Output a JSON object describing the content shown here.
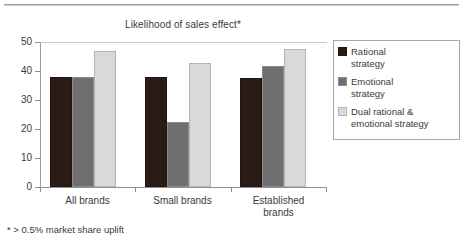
{
  "figure": {
    "top_rule": true,
    "footnote": "* > 0.5% market share uplift"
  },
  "chart_data": {
    "type": "bar",
    "title": "Likelihood of sales effect*",
    "xlabel": "",
    "ylabel": "",
    "ylim": [
      0,
      50
    ],
    "yticks": [
      0,
      10,
      20,
      30,
      40,
      50
    ],
    "ytick_labels": [
      "0",
      "10",
      "20",
      "30",
      "40",
      "50"
    ],
    "grid": false,
    "legend_position": "right",
    "categories": [
      "All brands",
      "Small brands",
      "Established brands"
    ],
    "series": [
      {
        "name": "Rational strategy",
        "legend_label_line1": "Rational",
        "legend_label_line2": "strategy",
        "color": "#2b1b16",
        "values": [
          38,
          37.8,
          37.6
        ]
      },
      {
        "name": "Emotional strategy",
        "legend_label_line1": "Emotional",
        "legend_label_line2": "strategy",
        "color": "#6f6f6f",
        "values": [
          38,
          22.5,
          41.6
        ]
      },
      {
        "name": "Dual rational & emotional strategy",
        "legend_label_line1": "Dual rational &",
        "legend_label_line2": "emotional strategy",
        "color": "#d9d9d9",
        "values": [
          47,
          42.7,
          47.6
        ]
      }
    ]
  },
  "axis": {
    "y_labels": [
      "50",
      "40",
      "30",
      "20",
      "10",
      "0"
    ]
  },
  "x_labels": [
    {
      "line1": "All brands",
      "line2": ""
    },
    {
      "line1": "Small brands",
      "line2": ""
    },
    {
      "line1": "Established",
      "line2": "brands"
    }
  ]
}
